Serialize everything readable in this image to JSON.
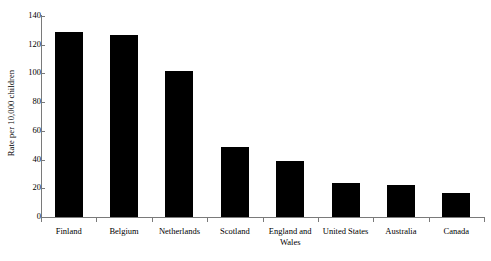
{
  "chart_data": {
    "type": "bar",
    "title": "",
    "xlabel": "",
    "ylabel": "Rate per 10,000 children",
    "ylim": [
      0,
      140
    ],
    "yticks": [
      0,
      20,
      40,
      60,
      80,
      100,
      120,
      140
    ],
    "grid": false,
    "legend": null,
    "categories": [
      "Finland",
      "Belgium",
      "Netherlands",
      "Scotland",
      "England and\nWales",
      "United States",
      "Australia",
      "Canada"
    ],
    "values": [
      129,
      127,
      102,
      49,
      39,
      24,
      22,
      17
    ],
    "bar_color": "#000000",
    "axis_color": "#7a7a7a"
  }
}
